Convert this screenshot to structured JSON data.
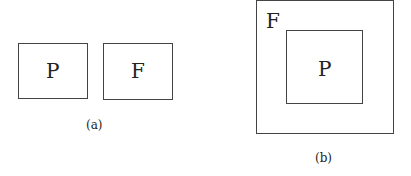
{
  "panel_a": {
    "boxes": [
      {
        "label": "P"
      },
      {
        "label": "F"
      }
    ],
    "caption": "(a)"
  },
  "panel_b": {
    "outer_label": "F",
    "inner_label": "P",
    "caption": "(b)"
  }
}
